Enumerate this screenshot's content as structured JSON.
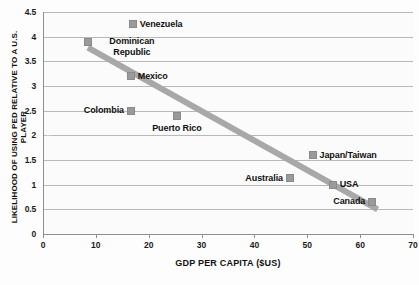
{
  "chart_data": {
    "type": "scatter",
    "title": "",
    "xlabel": "GDP PER CAPITA ($US)",
    "ylabel": "LIKELIHOOD OF USING PED RELATIVE TO A U.S. PLAYER",
    "xlim": [
      0,
      70
    ],
    "ylim": [
      0,
      4.5
    ],
    "xticks": [
      0,
      10,
      20,
      30,
      40,
      50,
      60,
      70
    ],
    "yticks": [
      "0",
      "0.5",
      "1",
      "1.5",
      "2",
      "2.5",
      "3",
      "3.5",
      "4",
      "4.5"
    ],
    "grid": "horizontal",
    "legend": "none",
    "points": [
      {
        "label": "Venezuela",
        "x": 17.0,
        "y": 4.25,
        "label_pos": "right",
        "lines": 1
      },
      {
        "label": "Dominican Republic",
        "x": 8.5,
        "y": 3.89,
        "label_pos": "right",
        "lines": 2
      },
      {
        "label": "Mexico",
        "x": 16.6,
        "y": 3.2,
        "label_pos": "right",
        "lines": 1
      },
      {
        "label": "Colombia",
        "x": 16.6,
        "y": 2.5,
        "label_pos": "left",
        "lines": 1
      },
      {
        "label": "Puerto Rico",
        "x": 25.3,
        "y": 2.4,
        "label_pos": "below",
        "lines": 1
      },
      {
        "label": "Japan/Taiwan",
        "x": 51.0,
        "y": 1.6,
        "label_pos": "right",
        "lines": 1
      },
      {
        "label": "Australia",
        "x": 46.8,
        "y": 1.13,
        "label_pos": "left",
        "lines": 1
      },
      {
        "label": "USA",
        "x": 54.8,
        "y": 1.0,
        "label_pos": "right",
        "lines": 1
      },
      {
        "label": "Canada",
        "x": 62.3,
        "y": 0.65,
        "label_pos": "left",
        "lines": 1
      }
    ],
    "trendline": {
      "x1": 8.5,
      "y1": 3.78,
      "x2": 63.3,
      "y2": 0.5,
      "color": "#a8a8a8",
      "width": 6
    }
  },
  "colors": {
    "marker": "#9a9a9a",
    "gridline": "#b9b9b9",
    "axis": "#8e8e8e",
    "text": "#111111",
    "background": "#fdfdfd"
  },
  "labels": {
    "ytick_0": "0",
    "ytick_1": "0.5",
    "ytick_2": "1",
    "ytick_3": "1.5",
    "ytick_4": "2",
    "ytick_5": "2.5",
    "ytick_6": "3",
    "ytick_7": "3.5",
    "ytick_8": "4",
    "ytick_9": "4.5",
    "xtick_0": "0",
    "xtick_1": "10",
    "xtick_2": "20",
    "xtick_3": "30",
    "xtick_4": "40",
    "xtick_5": "50",
    "xtick_6": "60",
    "xtick_7": "70"
  }
}
